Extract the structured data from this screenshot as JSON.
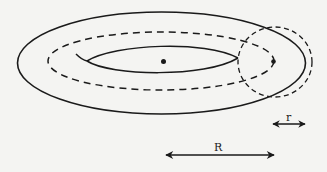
{
  "diagram": {
    "labels": {
      "minor_radius": "r",
      "major_radius": "R"
    },
    "colors": {
      "background": "#f4f4f2",
      "ink": "#1a1a1a"
    },
    "elements": [
      {
        "name": "outer-surface",
        "type": "ellipse",
        "style": "solid"
      },
      {
        "name": "center-circle-path",
        "type": "ellipse",
        "style": "dashed"
      },
      {
        "name": "inner-hole",
        "type": "lens",
        "style": "solid"
      },
      {
        "name": "cross-section",
        "type": "circle",
        "style": "dashed"
      },
      {
        "name": "torus-center",
        "type": "dot"
      },
      {
        "name": "tube-center",
        "type": "dot"
      },
      {
        "name": "minor-radius-arrow",
        "type": "double-arrow",
        "label": "r"
      },
      {
        "name": "major-radius-arrow",
        "type": "double-arrow",
        "label": "R"
      }
    ]
  }
}
